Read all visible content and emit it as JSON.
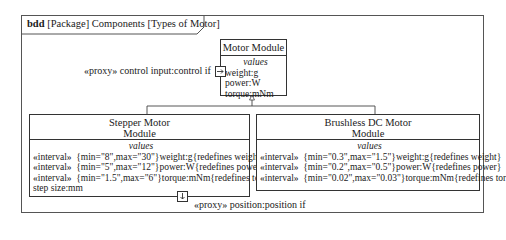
{
  "frame": {
    "kind": "bdd",
    "title_rest": "[Package] Components [Types of Motor]"
  },
  "motor_module": {
    "name": "Motor Module",
    "compartment_title": "values",
    "values": [
      "weight:g",
      "power:W",
      "torque:mNm"
    ]
  },
  "control_port": {
    "label": "«proxy» control input:control if"
  },
  "stepper_module": {
    "name_line1": "Stepper Motor",
    "name_line2": "Module",
    "compartment_title": "values",
    "values": [
      {
        "stereotype": "«interval»",
        "constraint": "{min=\"8\",max=\"30\"}",
        "property": "weight:g",
        "redefines": "{redefines weight}"
      },
      {
        "stereotype": "«interval»",
        "constraint": "{min=\"5\",max=\"12\"}",
        "property": "power:W",
        "redefines": "{redefines power}"
      },
      {
        "stereotype": "«interval»",
        "constraint": "{min=\"1.5\",max=\"6\"}",
        "property": "torque:mNm",
        "redefines": "{redefines torque}"
      }
    ],
    "extra_value": "step size:mm"
  },
  "brushless_module": {
    "name_line1": "Brushless DC Motor",
    "name_line2": "Module",
    "compartment_title": "values",
    "values": [
      {
        "stereotype": "«interval»",
        "constraint": "{min=\"0.3\",max=\"1.5\"}",
        "property": "weight:g",
        "redefines": "{redefines weight}"
      },
      {
        "stereotype": "«interval»",
        "constraint": "{min=\"0.2\",max=\"0.5\"}",
        "property": "power:W",
        "redefines": "{redefines power}"
      },
      {
        "stereotype": "«interval»",
        "constraint": "{min=\"0.02\",max=\"0.03\"}",
        "property": "torque:mNm",
        "redefines": "{redefines torque}"
      }
    ]
  },
  "position_port": {
    "label": "«proxy» position:position if"
  }
}
